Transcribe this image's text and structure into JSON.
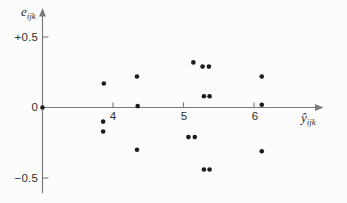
{
  "figure": {
    "background": "#fcfcfc",
    "axis_color": "#7a7a7a",
    "point_color": "#1c1c1c",
    "text_color": "#2e2e2e"
  },
  "chart_data": {
    "type": "scatter",
    "title": "",
    "xlabel": "ŷijk",
    "ylabel": "eijk",
    "xlabel_main": "ŷ",
    "xlabel_sub": "ijk",
    "ylabel_main": "e",
    "ylabel_sub": "ijk",
    "xlim": [
      3,
      7
    ],
    "ylim": [
      -0.65,
      0.7
    ],
    "grid": false,
    "legend": false,
    "x_ticks": [
      {
        "value": 4,
        "label": "4"
      },
      {
        "value": 5,
        "label": "5"
      },
      {
        "value": 6,
        "label": "6"
      }
    ],
    "y_ticks": [
      {
        "value": 0.5,
        "label": "+0.5"
      },
      {
        "value": 0,
        "label": "0"
      },
      {
        "value": -0.5,
        "label": "−0.5"
      }
    ],
    "points": [
      {
        "x": 3.0,
        "y": 0.0
      },
      {
        "x": 3.87,
        "y": 0.17
      },
      {
        "x": 3.86,
        "y": -0.1
      },
      {
        "x": 3.86,
        "y": -0.17
      },
      {
        "x": 4.34,
        "y": 0.22
      },
      {
        "x": 4.35,
        "y": 0.01
      },
      {
        "x": 4.34,
        "y": -0.3
      },
      {
        "x": 5.14,
        "y": 0.32
      },
      {
        "x": 5.27,
        "y": 0.29
      },
      {
        "x": 5.36,
        "y": 0.29
      },
      {
        "x": 5.29,
        "y": 0.08
      },
      {
        "x": 5.37,
        "y": 0.08
      },
      {
        "x": 5.07,
        "y": -0.21
      },
      {
        "x": 5.16,
        "y": -0.21
      },
      {
        "x": 5.29,
        "y": -0.44
      },
      {
        "x": 5.37,
        "y": -0.44
      },
      {
        "x": 6.11,
        "y": 0.22
      },
      {
        "x": 6.11,
        "y": 0.02
      },
      {
        "x": 6.11,
        "y": -0.31
      }
    ]
  }
}
